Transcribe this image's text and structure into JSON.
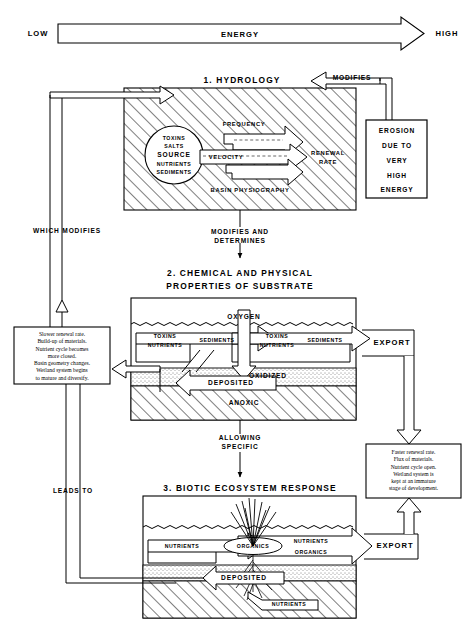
{
  "energy_axis": {
    "left_label": "LOW",
    "bar_label": "ENERGY",
    "right_label": "HIGH"
  },
  "connectors": {
    "modifies": "MODIFIES",
    "which_modifies": "WHICH MODIFIES",
    "modifies_and_determines_1": "MODIFIES AND",
    "modifies_and_determines_2": "DETERMINES",
    "allowing_1": "ALLOWING",
    "allowing_2": "SPECIFIC",
    "leads_to": "LEADS TO"
  },
  "erosion_box": {
    "lines": [
      "EROSION",
      "DUE TO",
      "VERY",
      "HIGH",
      "ENERGY"
    ]
  },
  "left_note": {
    "lines": [
      "Slower renewal rate.",
      "Build-up of materials.",
      "Nutrient cycle becomes",
      "more closed.",
      "Basin geometry changes.",
      "Wetland system begins",
      "to mature and diversify."
    ]
  },
  "right_note": {
    "lines": [
      "Faster renewal rate.",
      "Flux of materials.",
      "Nutrient cycle open.",
      "Wetland system is",
      "kept at an immature",
      "stage of development."
    ]
  },
  "panel1": {
    "heading": "1. HYDROLOGY",
    "source_circle": [
      "TOXINS",
      "SALTS",
      "SOURCE",
      "NUTRIENTS",
      "SEDIMENTS"
    ],
    "drivers": [
      "FREQUENCY",
      "VELOCITY",
      "BASIN PHYSIOGRAPHY"
    ],
    "outcome_1": "RENEWAL",
    "outcome_2": "RATE"
  },
  "panel2": {
    "heading_1": "2. CHEMICAL AND PHYSICAL",
    "heading_2": "PROPERTIES OF SUBSTRATE",
    "oxygen": "OXYGEN",
    "left_flow": [
      "TOXINS",
      "NUTRIENTS"
    ],
    "left_flow_2": "SEDIMENTS",
    "right_flow": [
      "TOXINS",
      "NUTRIENTS"
    ],
    "right_flow_2": "SEDIMENTS",
    "oxidized": "OXIDIZED",
    "deposited": "DEPOSITED",
    "anoxic": "ANOXIC",
    "export": "EXPORT"
  },
  "panel3": {
    "heading": "3. BIOTIC ECOSYSTEM RESPONSE",
    "left_flow": "NUTRIENTS",
    "organics": "ORGANICS",
    "right_flow_1": "NUTRIENTS",
    "right_flow_2": "ORGANICS",
    "deposited": "DEPOSITED",
    "root_nutrients": "NUTRIENTS",
    "export": "EXPORT"
  },
  "colors": {
    "ink": "#000000",
    "paper": "#ffffff",
    "hatch": "#000000",
    "stipple": "#000000"
  }
}
